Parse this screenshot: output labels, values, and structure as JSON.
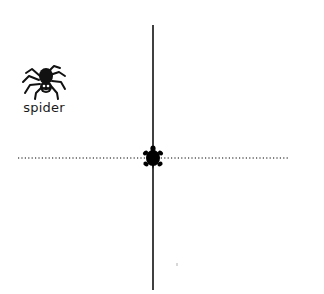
{
  "stage": {
    "background": "#ffffff",
    "width": 324,
    "height": 294
  },
  "sprite": {
    "name": "spider",
    "icon": "spider-icon",
    "color": "#111111"
  },
  "turtle": {
    "icon": "turtle-icon",
    "heading": "up",
    "x": 153,
    "y": 157,
    "color": "#000000"
  },
  "pen_lines": [
    {
      "type": "solid",
      "x1": 153,
      "y1": 25,
      "x2": 153,
      "y2": 290,
      "color": "#000000",
      "width": 1.5
    },
    {
      "type": "dotted",
      "x1": 18,
      "y1": 158,
      "x2": 290,
      "y2": 158,
      "color": "#000000",
      "width": 1
    }
  ]
}
